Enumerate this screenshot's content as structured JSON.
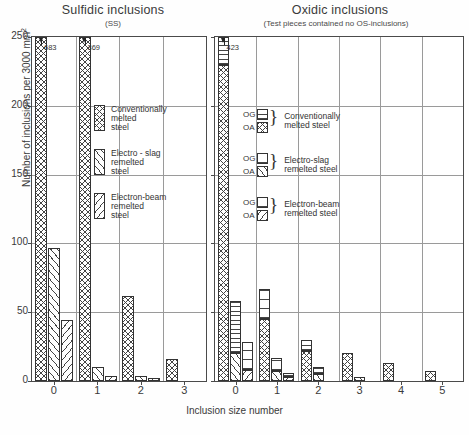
{
  "chart_data": [
    {
      "type": "bar",
      "title": "Sulfidic inclusions",
      "subtitle": "(SS)",
      "xlabel": "Inclusion size number",
      "ylabel": "Number of inclusions per 3000 mm²",
      "ylim": [
        0,
        250
      ],
      "yticks": [
        0,
        50,
        100,
        150,
        200,
        250
      ],
      "grid": true,
      "categories": [
        "0",
        "1",
        "2",
        "3"
      ],
      "series": [
        {
          "name": "Conventionally melted steel",
          "pattern": "cross-hatch",
          "values": [
            683,
            369,
            62,
            16
          ],
          "clipped": [
            true,
            true,
            false,
            false
          ],
          "clip_labels": [
            "683",
            "369",
            "",
            ""
          ]
        },
        {
          "name": "Electro-slag remelted steel",
          "pattern": "diagonal-hatch",
          "values": [
            97,
            10,
            4,
            0
          ],
          "clipped": [
            false,
            false,
            false,
            false
          ],
          "clip_labels": [
            "",
            "",
            "",
            ""
          ]
        },
        {
          "name": "Electron-beam remelted steel",
          "pattern": "reverse-diagonal-hatch",
          "values": [
            44,
            4,
            2,
            0
          ],
          "clipped": [
            false,
            false,
            false,
            false
          ],
          "clip_labels": [
            "",
            "",
            "",
            ""
          ]
        }
      ],
      "legend_position": "inside-upper-right"
    },
    {
      "type": "bar",
      "title": "Oxidic inclusions",
      "subtitle": "(Test pieces contained no OS-inclusions)",
      "xlabel": "Inclusion size number",
      "ylabel": "Number of inclusions per 3000 mm²",
      "ylim": [
        0,
        250
      ],
      "yticks": [
        0,
        50,
        100,
        150,
        200,
        250
      ],
      "grid": true,
      "stacked": true,
      "stack_components": [
        "OA",
        "OG"
      ],
      "categories": [
        "0",
        "1",
        "2",
        "3",
        "4",
        "5"
      ],
      "series": [
        {
          "name": "Conventionally melted steel",
          "pattern_oa": "cross-hatch",
          "pattern_og": "horizontal-hatch",
          "oa": [
            230,
            45,
            22,
            20,
            13,
            7
          ],
          "og": [
            193,
            22,
            8,
            0,
            0,
            0
          ],
          "totals": [
            423,
            67,
            30,
            20,
            13,
            7
          ],
          "clipped": [
            true,
            false,
            false,
            false,
            false,
            false
          ],
          "clip_labels": [
            "423",
            "",
            "",
            "",
            "",
            ""
          ]
        },
        {
          "name": "Electro-slag remelted steel",
          "pattern_oa": "diagonal-hatch",
          "pattern_og": "horizontal-hatch",
          "oa": [
            20,
            7,
            5,
            3,
            0,
            0
          ],
          "og": [
            38,
            10,
            5,
            0,
            0,
            0
          ],
          "totals": [
            58,
            17,
            10,
            3,
            0,
            0
          ],
          "clipped": [
            false,
            false,
            false,
            false,
            false,
            false
          ],
          "clip_labels": [
            "",
            "",
            "",
            "",
            "",
            ""
          ]
        },
        {
          "name": "Electron-beam remelted steel",
          "pattern_oa": "reverse-diagonal-hatch",
          "pattern_og": "horizontal-hatch",
          "oa": [
            8,
            3,
            0,
            0,
            0,
            0
          ],
          "og": [
            20,
            3,
            0,
            0,
            0,
            0
          ],
          "totals": [
            28,
            6,
            0,
            0,
            0,
            0
          ],
          "clipped": [
            false,
            false,
            false,
            false,
            false,
            false
          ],
          "clip_labels": [
            "",
            "",
            "",
            "",
            "",
            ""
          ]
        }
      ],
      "legend_position": "inside-upper-right"
    }
  ],
  "left": {
    "title": "Sulfidic inclusions",
    "subtitle": "(SS)",
    "ylabel_html": "Number of inclusions per 3000 mm",
    "ylabel_sup": "2",
    "yticks": [
      "0",
      "50",
      "100",
      "150",
      "200",
      "250"
    ],
    "xticks": [
      "0",
      "1",
      "2",
      "3"
    ],
    "legend": [
      {
        "pattern": "cross-hatch",
        "lines": [
          "Conventionally",
          "melted",
          "steel"
        ]
      },
      {
        "pattern": "diagonal-hatch",
        "lines": [
          "Electro - slag",
          "remelted",
          "steel"
        ]
      },
      {
        "pattern": "reverse-diagonal-hatch",
        "lines": [
          "Electron-beam",
          "remelted",
          "steel"
        ]
      }
    ]
  },
  "right": {
    "title": "Oxidic inclusions",
    "subtitle": "(Test pieces contained no OS-inclusions)",
    "yticks": [
      "0",
      "50",
      "100",
      "150",
      "200",
      "250"
    ],
    "xticks": [
      "0",
      "1",
      "2",
      "3",
      "4",
      "5"
    ],
    "legend": [
      {
        "og": "OG",
        "oa": "OA",
        "pattern_og": "horizontal-hatch",
        "pattern_oa": "cross-hatch",
        "lines": [
          "Conventionally",
          "melted steel"
        ]
      },
      {
        "og": "OG",
        "oa": "OA",
        "pattern_og": "horizontal-hatch",
        "pattern_oa": "diagonal-hatch",
        "lines": [
          "Electro-slag",
          "remelted steel"
        ]
      },
      {
        "og": "OG",
        "oa": "OA",
        "pattern_og": "horizontal-hatch",
        "pattern_oa": "reverse-diagonal-hatch",
        "lines": [
          "Electron-beam",
          "remelted steel"
        ]
      }
    ]
  },
  "axis": {
    "xlabel": "Inclusion size number"
  }
}
